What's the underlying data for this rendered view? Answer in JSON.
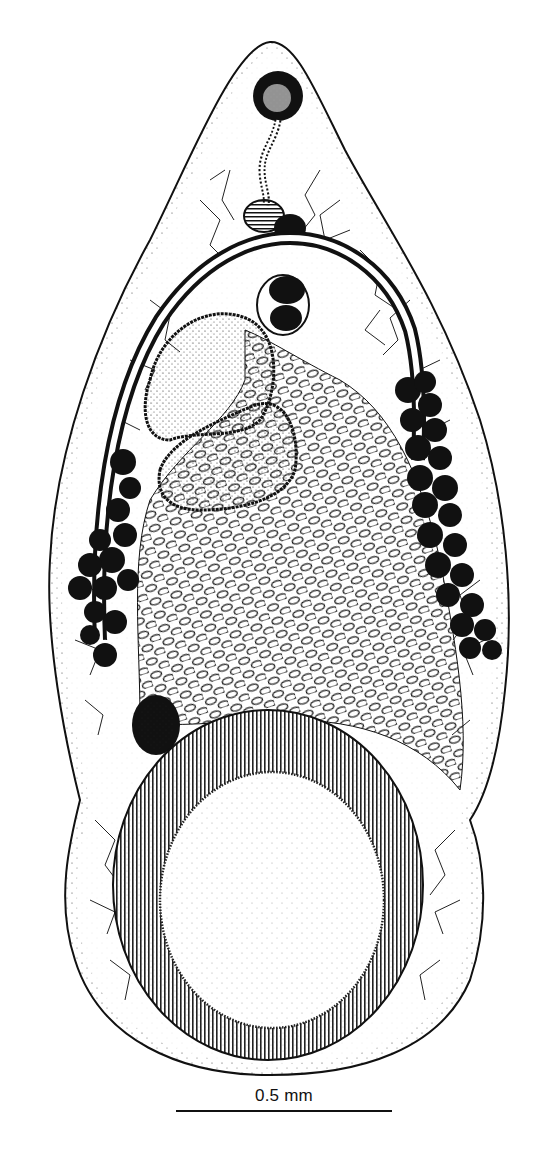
{
  "figure": {
    "colors": {
      "ink": "#111111",
      "paper": "#ffffff"
    },
    "structures": [
      "oral-sucker",
      "pharynx",
      "esophagus",
      "intestinal-caeca",
      "genital-pore",
      "testes",
      "vitellaria",
      "uterus-eggs",
      "ovary",
      "acetabulum",
      "tegument"
    ]
  },
  "scale_bar": {
    "label": "0.5 mm"
  }
}
